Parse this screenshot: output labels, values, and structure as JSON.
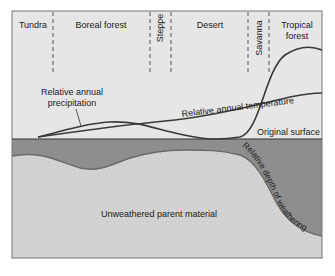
{
  "biomes": [
    {
      "label": "Tundra"
    },
    {
      "label": "Boreal forest"
    },
    {
      "label": "Steppe"
    },
    {
      "label": "Desert"
    },
    {
      "label": "Savanna"
    },
    {
      "label": "Tropical forest",
      "line1": "Tropical",
      "line2": "forest"
    }
  ],
  "curves": {
    "precipitation": {
      "line1": "Relative annual",
      "line2": "precipitation"
    },
    "temperature": "Relative annual temperature"
  },
  "surface": {
    "label": "Original surface"
  },
  "weathering": {
    "label": "Relative depth of weathering"
  },
  "parent_material": {
    "label": "Unweathered parent material"
  },
  "colors": {
    "sky": "#e4e4e4",
    "weathered": "#8c8c8c",
    "parent": "#d2d2d2",
    "line": "#333333"
  }
}
